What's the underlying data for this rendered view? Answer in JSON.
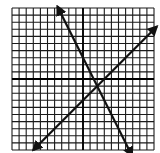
{
  "chart_data": {
    "type": "line",
    "title": "",
    "xlabel": "",
    "ylabel": "",
    "xlim": [
      -10,
      10
    ],
    "ylim": [
      -10,
      10
    ],
    "grid": true,
    "grid_step": 1,
    "axes_visible": true,
    "tick_labels": false,
    "legend": null,
    "series": [
      {
        "name": "line-negative-slope",
        "equation": "y = -2x + 3",
        "slope": -2,
        "intercept": 3,
        "x": [
          -3.6,
          6.9
        ],
        "y": [
          10.2,
          -10.8
        ],
        "arrows": "both"
      },
      {
        "name": "line-positive-slope",
        "equation": "y = x - 3",
        "slope": 1,
        "intercept": -3,
        "x": [
          -7.0,
          10.4
        ],
        "y": [
          -10.0,
          7.4
        ],
        "arrows": "both"
      }
    ],
    "intersection": {
      "x": 2,
      "y": -1
    }
  },
  "layout": {
    "left": 12,
    "top": 8,
    "cell": 7.1,
    "cells": 20,
    "grid_color": "#1a1a1a",
    "axis_color": "#000000",
    "line_color": "#111111"
  }
}
